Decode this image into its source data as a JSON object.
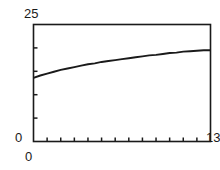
{
  "panel": {
    "tag": ")"
  },
  "chart_data": {
    "type": "line",
    "title": "",
    "subtitle": "",
    "xlabel": "",
    "ylabel": "",
    "xlim": [
      0,
      13
    ],
    "ylim": [
      0,
      25
    ],
    "grid": false,
    "legend": null,
    "axis_labels": {
      "y_max": "25",
      "y_min": "0",
      "x_min": "0",
      "x_max": "13"
    },
    "x_ticks": [
      0,
      1,
      2,
      3,
      4,
      5,
      6,
      7,
      8,
      9,
      10,
      11,
      12,
      13
    ],
    "x_tick_labels": [
      "0",
      "",
      "",
      "",
      "",
      "",
      "",
      "",
      "",
      "",
      "",
      "",
      "",
      "13"
    ],
    "y_ticks": [
      0,
      5,
      10,
      15,
      20,
      25
    ],
    "y_tick_labels": [
      "0",
      "",
      "",
      "",
      "",
      "25"
    ],
    "series": [
      {
        "name": "curve",
        "color": "#1a1a1a",
        "x": [
          0.0,
          0.5,
          1.0,
          1.5,
          2.0,
          2.5,
          3.0,
          3.5,
          4.0,
          4.5,
          5.0,
          5.5,
          6.0,
          6.5,
          7.0,
          7.5,
          8.0,
          8.5,
          9.0,
          9.5,
          10.0,
          10.5,
          11.0,
          11.5,
          12.0,
          12.5,
          13.0
        ],
        "values": [
          13.6,
          14.1,
          14.5,
          14.9,
          15.3,
          15.6,
          15.9,
          16.2,
          16.5,
          16.7,
          17.0,
          17.2,
          17.4,
          17.6,
          17.8,
          18.0,
          18.2,
          18.4,
          18.5,
          18.7,
          18.9,
          19.0,
          19.2,
          19.3,
          19.4,
          19.5,
          19.5
        ]
      }
    ]
  },
  "style": {
    "frame_color": "#1a1a1a",
    "curve_color": "#1a1a1a",
    "background": "#ffffff"
  }
}
